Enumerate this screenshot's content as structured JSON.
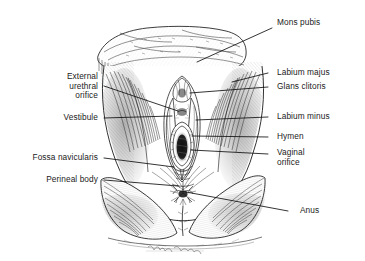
{
  "figure": {
    "style": "pen-and-ink crosshatch line drawing",
    "background_color": "#ffffff",
    "ink_color": "#1b1b1b",
    "leader_line_color": "#111111",
    "signature": "artist signature (cursive, illegible)"
  },
  "labels": {
    "mons_pubis": "Mons pubis",
    "labium_majus": "Labium majus",
    "glans_clitoris": "Glans clitoris",
    "labium_minus": "Labium minus",
    "hymen": "Hymen",
    "vaginal_orifice": "Vaginal\norifice",
    "anus": "Anus",
    "external_urethral_orifice": "External\nurethral\norifice",
    "vestibule": "Vestibule",
    "fossa_navicularis": "Fossa navicularis",
    "perineal_body": "Perineal body"
  }
}
